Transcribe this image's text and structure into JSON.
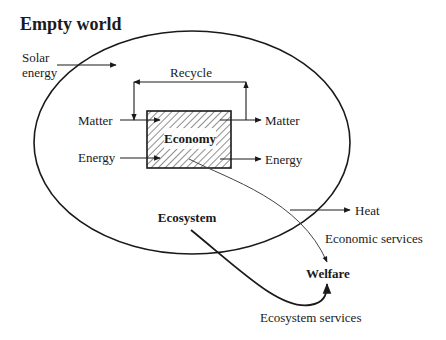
{
  "title": "Empty world",
  "labels": {
    "solar_line1": "Solar",
    "solar_line2": "energy",
    "recycle": "Recycle",
    "matter_in": "Matter",
    "energy_in": "Energy",
    "economy": "Economy",
    "matter_out": "Matter",
    "energy_out": "Energy",
    "heat": "Heat",
    "ecosystem": "Ecosystem",
    "economic_services": "Economic services",
    "welfare": "Welfare",
    "ecosystem_services": "Ecosystem services"
  },
  "colors": {
    "line": "#1a1a1a",
    "background": "#ffffff"
  }
}
